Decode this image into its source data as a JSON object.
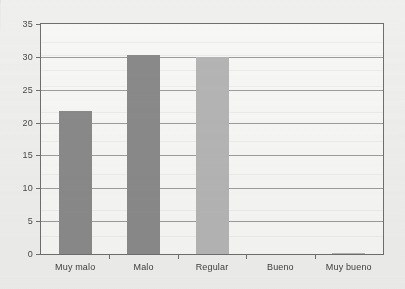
{
  "chart_data": {
    "type": "bar",
    "title": "",
    "subtitle": "",
    "xlabel": "",
    "ylabel": "",
    "categories": [
      "Muy malo",
      "Malo",
      "Regular",
      "Bueno",
      "Muy bueno"
    ],
    "values": [
      21.8,
      30.3,
      30.0,
      0,
      0.2
    ],
    "series": [
      {
        "name": "",
        "values": [
          21.8,
          30.3,
          30.0,
          0,
          0.2
        ]
      }
    ],
    "ylim": [
      0,
      35
    ],
    "yticks": [
      0,
      5,
      10,
      15,
      20,
      25,
      30,
      35
    ],
    "ytick_labels": [
      "0",
      "5",
      "10",
      "15",
      "20",
      "25",
      "30",
      "35"
    ],
    "grid": true,
    "grid_axis": "y",
    "legend": false,
    "legend_position": "none",
    "bar_colors": [
      "#8a8a8a",
      "#8a8a8a",
      "#b5b5b5",
      "#b5b5b5",
      "#b5b5b5"
    ],
    "annotations": []
  },
  "style": {
    "page_background": "#efefed",
    "plot_background": "#f7f7f5",
    "axis_color": "#6f6f6f",
    "gridline_color": "#8d8d8d",
    "tick_label_color": "#4a4a4a",
    "bar_dark": "#8a8a8a",
    "bar_light": "#b5b5b5"
  }
}
